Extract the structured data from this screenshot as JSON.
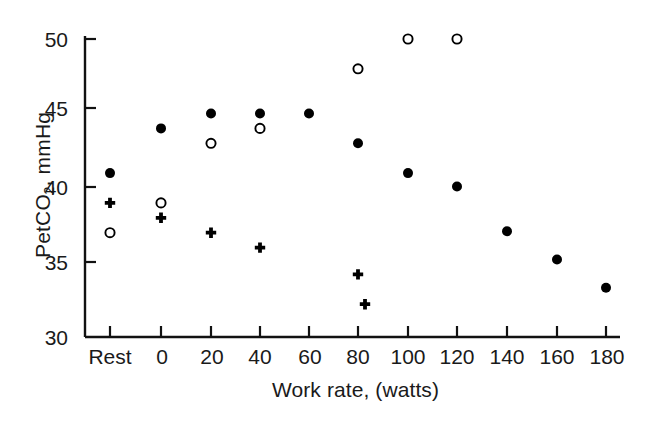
{
  "chart_data": {
    "type": "scatter",
    "title": "",
    "xlabel": "Work rate, (watts)",
    "ylabel": "PetCO2, mmHg",
    "ylabel_main": "PetCO",
    "ylabel_sub": "2",
    "ylabel_tail": ", mmHg",
    "xlim": [
      -1,
      10
    ],
    "ylim": [
      30,
      50
    ],
    "grid": false,
    "legend": "none",
    "categories": [
      "Rest",
      "0",
      "20",
      "40",
      "60",
      "80",
      "100",
      "120",
      "140",
      "160",
      "180"
    ],
    "x_tick_labels": [
      "Rest",
      "0",
      "20",
      "40",
      "60",
      "80",
      "100",
      "120",
      "140",
      "160",
      "180"
    ],
    "y_tick_labels": [
      "30",
      "35",
      "40",
      "45",
      "50"
    ],
    "y_ticks": [
      30,
      35,
      40,
      45,
      50
    ],
    "series": [
      {
        "name": "filled-circle",
        "marker": "filled-circle",
        "color": "#000000",
        "points": [
          {
            "x": "Rest",
            "y": 41.0
          },
          {
            "x": "0",
            "y": 44.0
          },
          {
            "x": "20",
            "y": 45.0
          },
          {
            "x": "40",
            "y": 45.0
          },
          {
            "x": "60",
            "y": 45.0
          },
          {
            "x": "80",
            "y": 43.0
          },
          {
            "x": "100",
            "y": 41.0
          },
          {
            "x": "120",
            "y": 40.1
          },
          {
            "x": "140",
            "y": 37.1
          },
          {
            "x": "160",
            "y": 35.2
          },
          {
            "x": "180",
            "y": 33.3
          }
        ]
      },
      {
        "name": "open-circle",
        "marker": "open-circle",
        "color": "#000000",
        "points": [
          {
            "x": "Rest",
            "y": 37.0
          },
          {
            "x": "0",
            "y": 39.0
          },
          {
            "x": "20",
            "y": 43.0
          },
          {
            "x": "40",
            "y": 44.0
          },
          {
            "x": "80",
            "y": 48.0
          },
          {
            "x": "100",
            "y": 50.0
          },
          {
            "x": "120",
            "y": 50.0
          }
        ]
      },
      {
        "name": "plus",
        "marker": "plus",
        "color": "#000000",
        "points": [
          {
            "x": "Rest",
            "y": 39.0
          },
          {
            "x": "0",
            "y": 38.0
          },
          {
            "x": "20",
            "y": 37.0
          },
          {
            "x": "40",
            "y": 36.0
          },
          {
            "x": "80",
            "y": 34.2
          },
          {
            "x": "80b",
            "y": 32.2
          }
        ]
      }
    ]
  },
  "axes": {
    "y_axis_title": "PetCO2, mmHg",
    "x_axis_title": "Work rate, (watts)"
  },
  "colors": {
    "axis": "#111111",
    "marker": "#000000",
    "background": "#ffffff"
  }
}
